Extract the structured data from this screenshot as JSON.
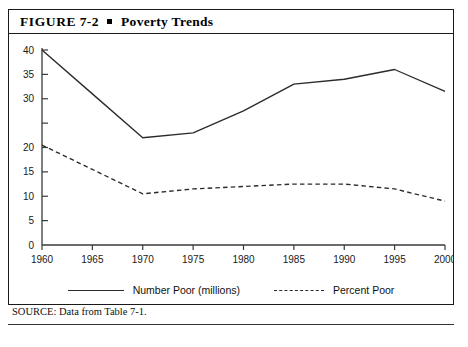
{
  "figure": {
    "label": "FIGURE",
    "number": "7-2",
    "bullet": "■",
    "title": "Poverty Trends",
    "source": "SOURCE: Data from Table 7-1."
  },
  "legend": {
    "position": "bottom-center",
    "items": [
      {
        "name": "series-number-poor",
        "label": "Number Poor (millions)",
        "style": "solid"
      },
      {
        "name": "series-percent-poor",
        "label": "Percent Poor",
        "style": "dashed"
      }
    ]
  },
  "axes": {
    "y_ticks": [
      40,
      35,
      30,
      25,
      20,
      15,
      10,
      5,
      0
    ],
    "y_tick_labels": [
      "40",
      "35",
      "30",
      "",
      "20",
      "15",
      "10",
      "5",
      "0"
    ],
    "x_ticks": [
      1960,
      1965,
      1970,
      1975,
      1980,
      1985,
      1990,
      1995,
      2000
    ],
    "x_tick_labels": [
      "1960",
      "1965",
      "1970",
      "1975",
      "1980",
      "1985",
      "1990",
      "1995",
      "2000"
    ]
  },
  "colors": {
    "line": "#2b2b2b",
    "axis": "#3a3a3a",
    "text": "#111111",
    "border": "#1a1a1a",
    "background": "#ffffff"
  },
  "chart_data": {
    "type": "line",
    "title": "Poverty Trends",
    "xlabel": "",
    "ylabel": "",
    "x": [
      1960,
      1965,
      1970,
      1975,
      1980,
      1985,
      1990,
      1995,
      2000
    ],
    "xlim": [
      1960,
      2000
    ],
    "ylim": [
      0,
      40
    ],
    "grid": false,
    "legend_position": "bottom-center",
    "series": [
      {
        "name": "Number Poor (millions)",
        "style": "solid",
        "values": [
          40,
          31,
          22,
          23,
          27.5,
          33,
          34,
          36,
          31.5
        ]
      },
      {
        "name": "Percent Poor",
        "style": "dashed",
        "values": [
          20.5,
          15.5,
          10.5,
          11.5,
          12,
          12.5,
          12.5,
          11.5,
          9
        ]
      }
    ]
  }
}
